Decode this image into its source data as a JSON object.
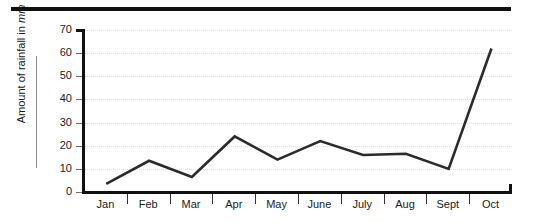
{
  "chart_data": {
    "type": "line",
    "title": "",
    "xlabel": "",
    "ylabel": "Amount of rainfall in mm",
    "ylabel_text": "Amount of rainfall in ",
    "ylabel_unit": "mm",
    "categories": [
      "Jan",
      "Feb",
      "Mar",
      "Apr",
      "May",
      "June",
      "July",
      "Aug",
      "Sept",
      "Oct"
    ],
    "values": [
      3.5,
      13.5,
      6.5,
      24,
      14,
      22,
      16,
      16.5,
      10,
      62
    ],
    "series": [
      {
        "name": "Rainfall",
        "values": [
          3.5,
          13.5,
          6.5,
          24,
          14,
          22,
          16,
          16.5,
          10,
          62
        ]
      }
    ],
    "ylim": [
      0,
      70
    ],
    "yticks": [
      0,
      10,
      20,
      30,
      40,
      50,
      60,
      70
    ],
    "ytick_labels": [
      "0",
      "10",
      "20",
      "30",
      "40",
      "50",
      "60",
      "70"
    ],
    "grid": "horizontal-dotted",
    "legend": "none",
    "line_color": "#2b2b2b",
    "grid_color": "#e2e2e2",
    "axis_color": "#111111"
  },
  "decorations": {
    "top_rule_color": "#101010"
  }
}
